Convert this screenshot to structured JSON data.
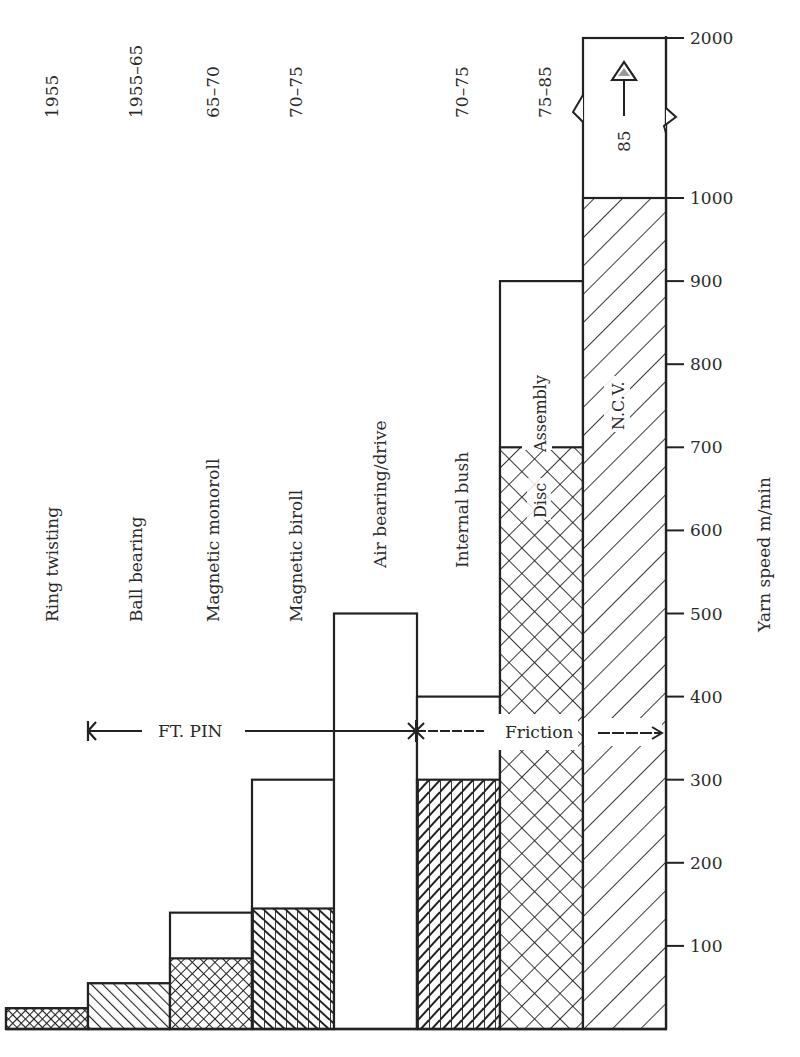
{
  "chart_data": {
    "type": "bar",
    "title": "",
    "xlabel": "",
    "ylabel": "Yarn speed m/min",
    "ylim": [
      0,
      2000
    ],
    "axis_break": {
      "between": [
        1000,
        2000
      ],
      "note": "broken scale above 1000"
    },
    "y_ticks": [
      100,
      200,
      300,
      400,
      500,
      600,
      700,
      800,
      900,
      1000,
      2000
    ],
    "categories": [
      "Ring twisting",
      "Ball bearing",
      "Magnetic monoroll",
      "Magnetic biroll",
      "Air bearing/drive",
      "Internal bush",
      "Disc / Assembly",
      "N.C.V."
    ],
    "years": [
      "1955",
      "1955–65",
      "65–70",
      "70–75",
      "",
      "70–75",
      "75–85",
      "85"
    ],
    "series": [
      {
        "name": "hatched (lower)",
        "values": [
          25,
          55,
          85,
          145,
          0,
          300,
          700,
          1000
        ]
      },
      {
        "name": "outline (upper)",
        "values": [
          25,
          55,
          140,
          300,
          500,
          400,
          900,
          2000
        ]
      }
    ],
    "inner_labels": [
      {
        "bar": 6,
        "text": "Disc"
      },
      {
        "bar": 6,
        "text": "Assembly"
      },
      {
        "bar": 7,
        "text": "N.C.V."
      },
      {
        "bar": 7,
        "text": "85"
      }
    ],
    "annotations": [
      {
        "text": "FT. PIN",
        "type": "arrow-left",
        "range": [
          "Ring twisting",
          "Air bearing/drive"
        ]
      },
      {
        "text": "Friction",
        "type": "arrow-right",
        "range": [
          "Air bearing/drive",
          "N.C.V."
        ]
      }
    ],
    "grid": false,
    "legend": "none"
  },
  "labels": {
    "y_axis_title": "Yarn speed m/min",
    "ft_pin": "FT. PIN",
    "friction": "Friction",
    "disc": "Disc",
    "assembly": "Assembly",
    "ncv": "N.C.V.",
    "ncv_year": "85"
  },
  "colors": {
    "ink": "#2a2a2a",
    "background": "#ffffff"
  }
}
